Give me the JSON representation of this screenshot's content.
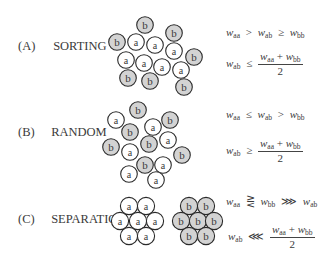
{
  "colors": {
    "a_fill": "#ffffff",
    "b_fill": "#d3d3d3",
    "stroke": "#2a2a2a",
    "text": "#3a3a3a"
  },
  "sections": [
    {
      "tag": "(A)",
      "title": "SORTING",
      "condition_1": {
        "lhs": "w",
        "lhs_sub": "aa",
        "rel1": ">",
        "mid": "w",
        "mid_sub": "ab",
        "rel2": "≥",
        "rhs": "w",
        "rhs_sub": "bb"
      },
      "condition_2": {
        "lhs": "w",
        "lhs_sub": "ab",
        "rel": "≤",
        "num_a": "w",
        "num_a_sub": "aa",
        "plus": "+",
        "num_b": "w",
        "num_b_sub": "bb",
        "den": "2"
      },
      "particles": [
        {
          "t": "b",
          "x": 145,
          "y": 25
        },
        {
          "t": "b",
          "x": 174,
          "y": 33
        },
        {
          "t": "b",
          "x": 117,
          "y": 42
        },
        {
          "t": "a",
          "x": 136,
          "y": 42
        },
        {
          "t": "a",
          "x": 155,
          "y": 45
        },
        {
          "t": "a",
          "x": 174,
          "y": 51
        },
        {
          "t": "b",
          "x": 194,
          "y": 57
        },
        {
          "t": "a",
          "x": 126,
          "y": 60
        },
        {
          "t": "a",
          "x": 144,
          "y": 63
        },
        {
          "t": "a",
          "x": 162,
          "y": 67
        },
        {
          "t": "a",
          "x": 181,
          "y": 70
        },
        {
          "t": "b",
          "x": 128,
          "y": 78
        },
        {
          "t": "b",
          "x": 150,
          "y": 81
        },
        {
          "t": "b",
          "x": 184,
          "y": 87
        }
      ]
    },
    {
      "tag": "(B)",
      "title": "RANDOM",
      "condition_1": {
        "lhs": "w",
        "lhs_sub": "aa",
        "rel1": "≤",
        "mid": "w",
        "mid_sub": "ab",
        "rel2": ">",
        "rhs": "w",
        "rhs_sub": "bb"
      },
      "condition_2": {
        "lhs": "w",
        "lhs_sub": "ab",
        "rel": "≥",
        "num_a": "w",
        "num_a_sub": "aa",
        "plus": "+",
        "num_b": "w",
        "num_b_sub": "bb",
        "den": "2"
      },
      "particles": [
        {
          "t": "b",
          "x": 138,
          "y": 110
        },
        {
          "t": "a",
          "x": 116,
          "y": 120
        },
        {
          "t": "b",
          "x": 170,
          "y": 120
        },
        {
          "t": "a",
          "x": 153,
          "y": 127
        },
        {
          "t": "b",
          "x": 130,
          "y": 132
        },
        {
          "t": "a",
          "x": 168,
          "y": 140
        },
        {
          "t": "b",
          "x": 149,
          "y": 144
        },
        {
          "t": "b",
          "x": 111,
          "y": 147
        },
        {
          "t": "a",
          "x": 130,
          "y": 152
        },
        {
          "t": "b",
          "x": 182,
          "y": 155
        },
        {
          "t": "b",
          "x": 145,
          "y": 165
        },
        {
          "t": "a",
          "x": 163,
          "y": 165
        },
        {
          "t": "a",
          "x": 129,
          "y": 174
        },
        {
          "t": "a",
          "x": 156,
          "y": 180
        }
      ]
    },
    {
      "tag": "(C)",
      "title": "SEPARATION",
      "condition_1": {
        "lhs": "w",
        "lhs_sub": "aa",
        "rel1": "⋛",
        "mid": "w",
        "mid_sub": "bb",
        "rel2": "⋙",
        "rhs": "w",
        "rhs_sub": "ab"
      },
      "condition_2": {
        "lhs": "w",
        "lhs_sub": "ab",
        "rel": "⋘",
        "num_a": "w",
        "num_a_sub": "aa",
        "plus": "+",
        "num_b": "w",
        "num_b_sub": "bb",
        "den": "2"
      },
      "particles": [
        {
          "t": "a",
          "x": 129,
          "y": 206
        },
        {
          "t": "a",
          "x": 146,
          "y": 206
        },
        {
          "t": "a",
          "x": 120,
          "y": 221
        },
        {
          "t": "a",
          "x": 138,
          "y": 221
        },
        {
          "t": "a",
          "x": 155,
          "y": 221
        },
        {
          "t": "a",
          "x": 129,
          "y": 236
        },
        {
          "t": "a",
          "x": 146,
          "y": 236
        },
        {
          "t": "b",
          "x": 189,
          "y": 206
        },
        {
          "t": "b",
          "x": 206,
          "y": 206
        },
        {
          "t": "b",
          "x": 181,
          "y": 221
        },
        {
          "t": "b",
          "x": 198,
          "y": 221
        },
        {
          "t": "b",
          "x": 214,
          "y": 221
        },
        {
          "t": "b",
          "x": 189,
          "y": 236
        },
        {
          "t": "b",
          "x": 206,
          "y": 236
        }
      ]
    }
  ]
}
